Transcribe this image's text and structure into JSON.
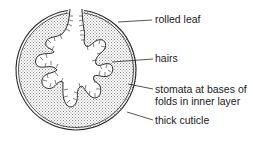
{
  "diagram": {
    "colors": {
      "outline": "#2a2a2a",
      "stipple": "#9a9a9a",
      "background": "#ffffff",
      "text": "#1a1a1a"
    },
    "labels": [
      {
        "id": "rolled-leaf",
        "text": "rolled leaf"
      },
      {
        "id": "hairs",
        "text": "hairs"
      },
      {
        "id": "stomata-line1",
        "text": "stomata at bases of"
      },
      {
        "id": "stomata-line2",
        "text": "folds in inner layer"
      },
      {
        "id": "thick-cuticle",
        "text": "thick cuticle"
      }
    ]
  }
}
